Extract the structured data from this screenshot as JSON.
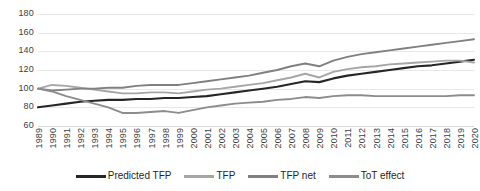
{
  "chart_data": {
    "type": "line",
    "title": "",
    "subtitle": "",
    "xlabel": "",
    "ylabel": "",
    "grid": true,
    "legend_position": "bottom",
    "xlim": [
      1989,
      2020
    ],
    "ylim": [
      60,
      180
    ],
    "y_ticks": [
      180,
      160,
      140,
      120,
      100,
      80,
      60
    ],
    "categories": [
      "1989",
      "1990",
      "1991",
      "1992",
      "1993",
      "1994",
      "1995",
      "1996",
      "1997",
      "1998",
      "1999",
      "2000",
      "2001",
      "2002",
      "2003",
      "2004",
      "2005",
      "2006",
      "2007",
      "2008",
      "2009",
      "2010",
      "2011",
      "2012",
      "2013",
      "2014",
      "2015",
      "2016",
      "2017",
      "2018",
      "2019",
      "2020"
    ],
    "series": [
      {
        "name": "Predicted TFP",
        "color": "#262626",
        "values": [
          80,
          82,
          84,
          86,
          87,
          88,
          88,
          89,
          89,
          90,
          90,
          91,
          92,
          94,
          96,
          98,
          100,
          102,
          105,
          108,
          107,
          111,
          114,
          116,
          118,
          120,
          122,
          124,
          125,
          127,
          129,
          131
        ]
      },
      {
        "name": "TFP",
        "color": "#a6a6a6",
        "values": [
          100,
          104,
          103,
          101,
          99,
          97,
          95,
          95,
          96,
          96,
          95,
          97,
          99,
          100,
          102,
          104,
          106,
          109,
          112,
          116,
          112,
          118,
          121,
          123,
          124,
          126,
          127,
          128,
          129,
          130,
          130,
          128
        ]
      },
      {
        "name": "TFP net",
        "color": "#808080",
        "values": [
          100,
          98,
          99,
          100,
          100,
          101,
          101,
          103,
          104,
          104,
          104,
          106,
          108,
          110,
          112,
          114,
          117,
          120,
          124,
          127,
          124,
          130,
          134,
          137,
          139,
          141,
          143,
          145,
          147,
          149,
          151,
          153
        ]
      },
      {
        "name": "ToT effect",
        "color": "#8c8c8c",
        "values": [
          100,
          97,
          92,
          88,
          84,
          80,
          74,
          74,
          75,
          76,
          74,
          77,
          80,
          82,
          84,
          85,
          86,
          88,
          89,
          91,
          90,
          92,
          93,
          93,
          92,
          92,
          92,
          92,
          92,
          92,
          93,
          93
        ]
      }
    ]
  },
  "legend": {
    "items": [
      {
        "label": "Predicted TFP",
        "color": "#262626"
      },
      {
        "label": "TFP",
        "color": "#a6a6a6"
      },
      {
        "label": "TFP net",
        "color": "#808080"
      },
      {
        "label": "ToT effect",
        "color": "#8c8c8c"
      }
    ]
  },
  "axis": {
    "y_labels": [
      "180",
      "160",
      "140",
      "120",
      "100",
      "80",
      "60"
    ],
    "x_labels": [
      "1989",
      "1990",
      "1991",
      "1992",
      "1993",
      "1994",
      "1995",
      "1996",
      "1997",
      "1998",
      "1999",
      "2000",
      "2001",
      "2002",
      "2003",
      "2004",
      "2005",
      "2006",
      "2007",
      "2008",
      "2009",
      "2010",
      "2011",
      "2012",
      "2013",
      "2014",
      "2015",
      "2016",
      "2017",
      "2018",
      "2019",
      "2020"
    ]
  }
}
